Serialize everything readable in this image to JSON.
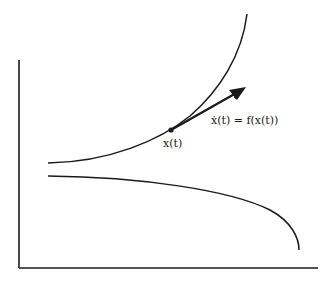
{
  "diagram": {
    "type": "phase-flow-sketch",
    "point_label": "x(t)",
    "vector_label": "ẋ(t) = f(x(t))",
    "colors": {
      "background": "#ffffff",
      "stroke": "#1a1a1a"
    },
    "elements": {
      "axes": [
        "vertical-axis",
        "horizontal-axis"
      ],
      "curves": [
        "upper-trajectory",
        "lower-trajectory"
      ],
      "point": "state-point",
      "vector": "tangent-velocity-arrow"
    }
  }
}
